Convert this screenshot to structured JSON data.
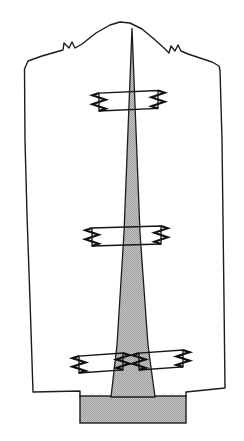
{
  "figure": {
    "title": "Pattern piece with shaded center gore and ric-rac trim placement",
    "kind": "line-drawing-diagram",
    "caption": "",
    "canvas": {
      "width": 244,
      "height": 441
    },
    "colors": {
      "background": "#ffffff",
      "ink": "#1c1c1c",
      "shading": "#b8b8b8",
      "shading_dark": "#a8a8a8",
      "trim_stroke": "#111111"
    }
  },
  "shapes": {
    "outline": {
      "label": "garment-panel-outline",
      "fill": "#ffffff",
      "stroke": "#1c1c1c",
      "path": "M 24.5 69 L 28 61 L 42 56 L 56 52 L 63 50 L 64 43 L 69 48 L 72 42 L 75 48 L 82 44 L 96 33 L 110 25 L 120 22 L 130 23 L 142 29 L 154 39 L 164 48 L 169 53 L 171 46 L 175 51 L 178 45 L 181 51 L 188 54 L 200 58 L 212 62 L 219 66 L 220 70 L 222 140 L 223 220 L 224 300 L 225 388 L 186 392 L 186 397 L 80 397 L 80 391 L 33 392 L 30 300 L 27 215 L 25 140 Z"
    },
    "gore": {
      "label": "shaded-center-gore",
      "fill": "#b8b8b8",
      "stroke": "#1c1c1c",
      "path": "M 132 28 L 140 233 L 148 345 L 155 397 L 111 397 L 117 345 L 124 233 Z"
    },
    "base_tab": {
      "label": "shaded-base-tab",
      "fill": "#b8b8b8",
      "stroke": "#1c1c1c",
      "x": 80,
      "y": 396,
      "width": 106,
      "height": 27
    }
  },
  "trim_markers": [
    {
      "id": "trim-marker-upper",
      "label": "ric-rac trim placement line upper",
      "x": 99,
      "y": 93,
      "width": 59,
      "height": 18,
      "skew": -2.5,
      "zigzags": [
        "left",
        "right"
      ]
    },
    {
      "id": "trim-marker-middle",
      "label": "ric-rac trim placement line middle",
      "x": 92,
      "y": 228,
      "width": 69,
      "height": 18,
      "skew": -2.0,
      "zigzags": [
        "left",
        "right"
      ]
    },
    {
      "id": "trim-marker-lower-left",
      "label": "ric-rac trim placement line lower left",
      "x": 79,
      "y": 356,
      "width": 44,
      "height": 17,
      "skew": -3.0,
      "zigzags": [
        "left",
        "right"
      ]
    },
    {
      "id": "trim-marker-lower-right",
      "label": "ric-rac trim placement line lower right",
      "x": 139,
      "y": 353,
      "width": 44,
      "height": 17,
      "skew": -3.0,
      "zigzags": [
        "left",
        "right"
      ]
    }
  ]
}
